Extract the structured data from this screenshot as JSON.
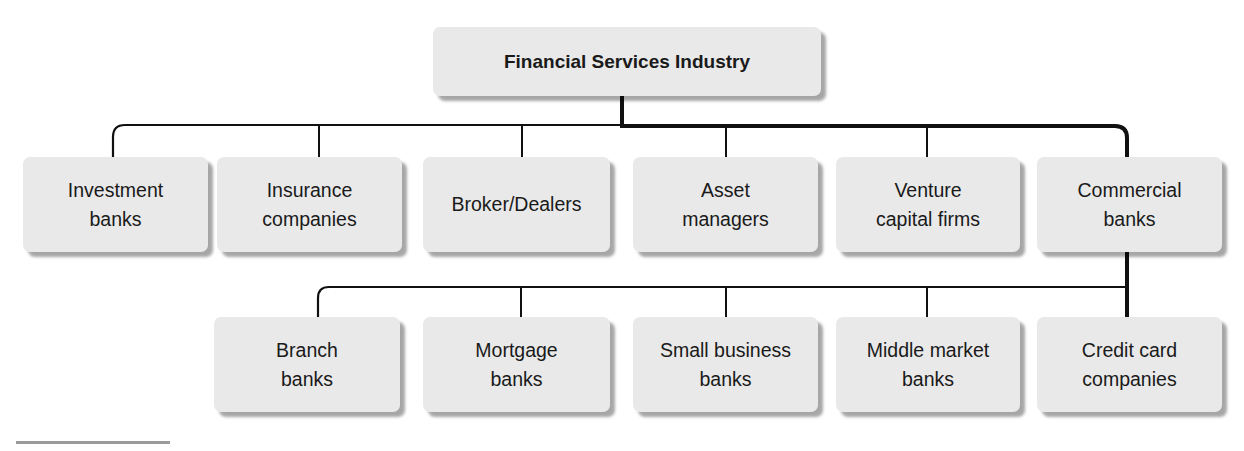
{
  "title": "Financial Services Industry",
  "root": {
    "label": "Financial Services Industry"
  },
  "level1": [
    {
      "label": "Investment\nbanks"
    },
    {
      "label": "Insurance\ncompanies"
    },
    {
      "label": "Broker/Dealers"
    },
    {
      "label": "Asset\nmanagers"
    },
    {
      "label": "Venture\ncapital firms"
    },
    {
      "label": "Commercial\nbanks"
    }
  ],
  "level2_parent": "Commercial banks",
  "level2": [
    {
      "label": "Branch\nbanks"
    },
    {
      "label": "Mortgage\nbanks"
    },
    {
      "label": "Small business\nbanks"
    },
    {
      "label": "Middle market\nbanks"
    },
    {
      "label": "Credit card\ncompanies"
    }
  ],
  "colors": {
    "box_fill": "#e9e9e9",
    "line": "#111111",
    "divider": "#9a9a9a"
  }
}
